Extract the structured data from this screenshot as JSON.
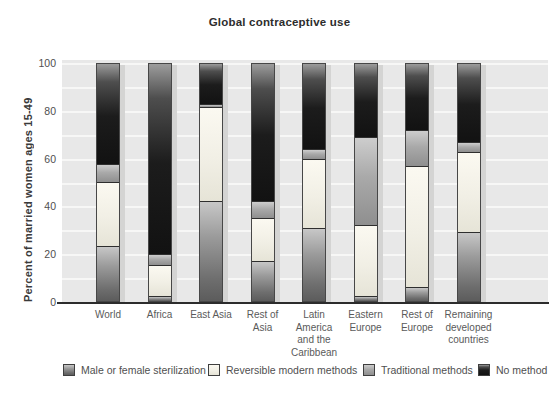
{
  "title": "Global contraceptive use",
  "y_axis": {
    "label": "Percent of married women ages 15-49",
    "ticks": [
      0,
      20,
      40,
      60,
      80,
      100
    ]
  },
  "legend": {
    "items": [
      {
        "key": "sterilization",
        "label": "Male or female sterilization",
        "color": "#7a7a7a"
      },
      {
        "key": "reversible",
        "label": "Reversible modern methods",
        "color": "#f1efe5"
      },
      {
        "key": "traditional",
        "label": "Traditional methods",
        "color": "#a9a9a9"
      },
      {
        "key": "no_method",
        "label": "No method",
        "color": "#1c1c1c"
      }
    ]
  },
  "colors": {
    "plot_background": "#e8e8e8",
    "gridline": "#f7f7f6",
    "axis_line": "#2c2c2c",
    "bar_shadow": "#d4d4d3"
  },
  "chart_data": {
    "type": "bar",
    "stacked": true,
    "title": "Global contraceptive use",
    "xlabel": "",
    "ylabel": "Percent of married women ages 15-49",
    "ylim": [
      0,
      100
    ],
    "grid": "horizontal white lines every 10 units",
    "legend_position": "bottom",
    "categories": [
      "World",
      "Africa",
      "East Asia",
      "Rest of Asia",
      "Latin America and the Caribbean",
      "Eastern Europe",
      "Rest of Europe",
      "Remaining developed countries"
    ],
    "category_label_lines": [
      [
        "World"
      ],
      [
        "Africa"
      ],
      [
        "East Asia"
      ],
      [
        "Rest of",
        "Asia"
      ],
      [
        "Latin",
        "America",
        "and the",
        "Caribbean"
      ],
      [
        "Eastern",
        "Europe"
      ],
      [
        "Rest of",
        "Europe"
      ],
      [
        "Remaining",
        "developed",
        "countries"
      ]
    ],
    "series": [
      {
        "name": "Male or female sterilization",
        "key": "sterilization",
        "values": [
          23,
          2,
          42,
          17,
          31,
          2,
          6,
          29
        ]
      },
      {
        "name": "Reversible modern methods",
        "key": "reversible",
        "values": [
          27,
          13,
          40,
          18,
          29,
          30,
          51,
          34
        ]
      },
      {
        "name": "Traditional methods",
        "key": "traditional",
        "values": [
          8,
          5,
          1,
          7,
          4,
          37,
          15,
          4
        ]
      },
      {
        "name": "No method",
        "key": "no_method",
        "values": [
          42,
          80,
          17,
          58,
          36,
          31,
          28,
          33
        ]
      }
    ]
  }
}
